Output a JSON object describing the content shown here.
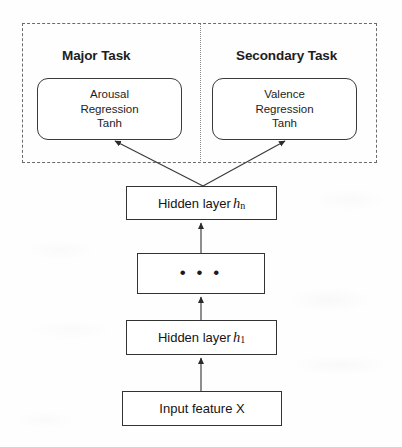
{
  "diagram": {
    "background_color": "#fefefe",
    "line_color": "#333333",
    "text_color": "#1d1d1d"
  },
  "task_region": {
    "label_major": "Major Task",
    "label_secondary": "Secondary Task",
    "border_style": "dashed",
    "divider_style": "dotted"
  },
  "output_boxes": [
    {
      "name": "arousal-regression",
      "line1": "Arousal",
      "line2": "Regression",
      "line3": "Tanh"
    },
    {
      "name": "valence-regression",
      "line1": "Valence",
      "line2": "Regression",
      "line3": "Tanh"
    }
  ],
  "layers": {
    "hidden_n": {
      "text": "Hidden layer",
      "var": "h",
      "subscript": "n"
    },
    "ellipsis": {
      "text": "• • •"
    },
    "hidden_1": {
      "text": "Hidden layer",
      "var": "h",
      "subscript": "1"
    },
    "input": {
      "text": "Input feature X"
    }
  },
  "connections": [
    {
      "from": "hidden_n",
      "to": "arousal-regression",
      "style": "arrow"
    },
    {
      "from": "hidden_n",
      "to": "valence-regression",
      "style": "arrow"
    },
    {
      "from": "ellipsis",
      "to": "hidden_n",
      "style": "arrow"
    },
    {
      "from": "hidden_1",
      "to": "ellipsis",
      "style": "arrow"
    },
    {
      "from": "input",
      "to": "hidden_1",
      "style": "arrow"
    }
  ]
}
